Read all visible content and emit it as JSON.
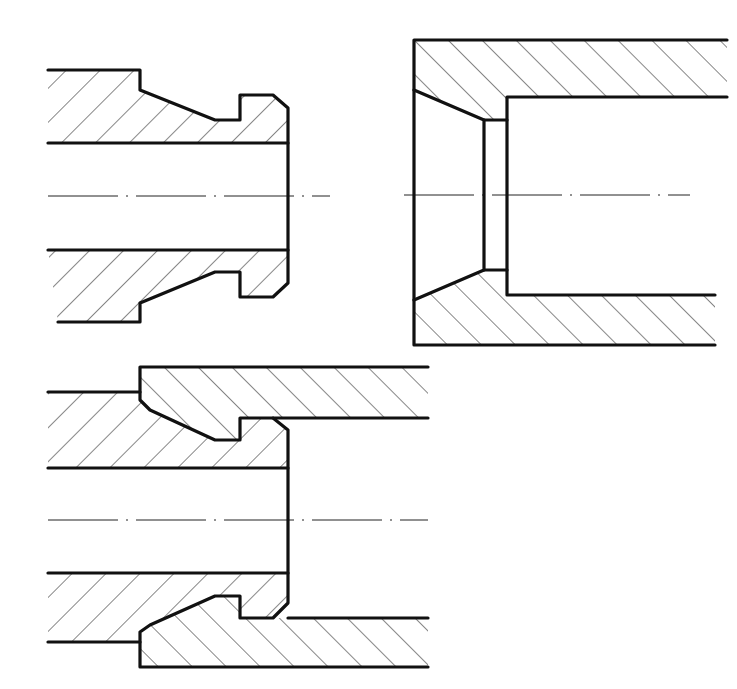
{
  "colors": {
    "line": "#111111",
    "background": "#ffffff",
    "hatch": "#222222"
  },
  "views": [
    {
      "id": "male-fitting",
      "label": "Male nipple section (detached)",
      "centerline": {
        "x1": 48,
        "x2": 330,
        "y": 196
      },
      "sections": [
        {
          "name": "male-upper-wall",
          "hatch": "fwd",
          "points": "48,70 140,70 140,90 215,120 240,120 240,95 273,95 288,108 288,143 48,143"
        },
        {
          "name": "male-lower-wall",
          "hatch": "fwd",
          "points": "48,250 288,250 288,283 273,297 240,297 240,272 215,272 140,303 140,322 58,322"
        }
      ],
      "lines": [
        "48,70 140,70 140,90 215,120 240,120 240,95 273,95 288,108 288,283 273,297 240,297 240,272 215,272 140,303 140,322 58,322",
        "48,143 288,143",
        "48,250 288,250"
      ]
    },
    {
      "id": "female-fitting",
      "label": "Female socket section (detached)",
      "centerline": {
        "x1": 404,
        "x2": 690,
        "y": 195
      },
      "sections": [
        {
          "name": "female-upper-wall",
          "hatch": "back",
          "points": "414,40 727,40 727,97 507,97 507,120 484,120 414,90"
        },
        {
          "name": "female-lower-wall",
          "hatch": "back",
          "points": "414,300 484,270 507,270 507,295 715,295 715,345 414,345"
        }
      ],
      "lines": [
        "727,40 414,40 414,345 715,345",
        "414,90 484,120 484,270 414,300",
        "727,97 507,97 507,295 715,295",
        "484,120 507,120",
        "484,270 507,270"
      ]
    },
    {
      "id": "assembled",
      "label": "Assembled joint section",
      "centerline": {
        "x1": 48,
        "x2": 428,
        "y": 520
      },
      "sections": [
        {
          "name": "assembly-female-upper",
          "hatch": "back",
          "points": "140,367 428,367 428,418 240,418 240,440 215,440 150,410 140,400"
        },
        {
          "name": "assembly-male-upper",
          "hatch": "fwd",
          "points": "48,392 140,392 140,400 150,410 215,440 240,440 240,418 273,418 288,430 288,468 48,468"
        },
        {
          "name": "assembly-male-lower",
          "hatch": "fwd",
          "points": "48,573 288,573 288,603 273,618 240,618 240,596 215,596 150,625 140,632 140,642 48,642"
        },
        {
          "name": "assembly-female-lower",
          "hatch": "back",
          "points": "140,632 150,625 215,596 240,596 240,618 428,618 428,667 140,667"
        }
      ],
      "lines": [
        "48,392 140,392",
        "428,367 140,367 140,400 150,410 215,440 240,440 240,418 273,418 288,430 288,603 273,618 240,618 240,596 215,596 150,625 140,632 140,667 428,667",
        "428,418 273,418",
        "48,468 288,468",
        "48,573 288,573",
        "48,642 140,642",
        "288,618 428,618"
      ]
    }
  ]
}
